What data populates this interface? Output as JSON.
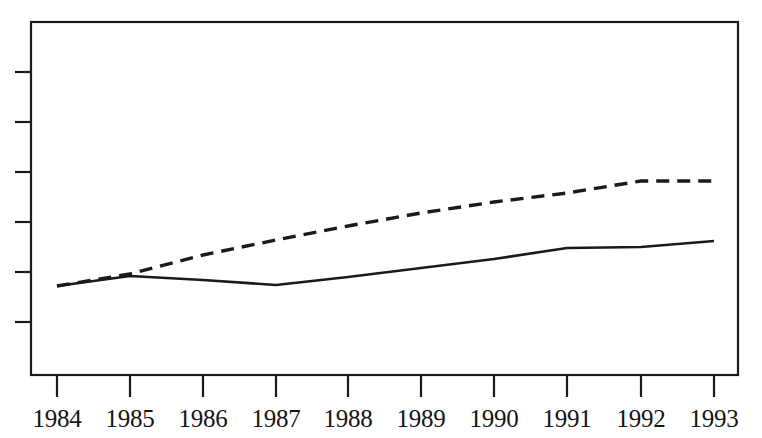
{
  "figure": {
    "background_color": "#ffffff",
    "ink_color": "#1a1a1a",
    "frame": {
      "left": 31,
      "top": 22,
      "right": 738,
      "bottom": 375
    }
  },
  "chart_data": {
    "type": "line",
    "title": "",
    "subtitle": "",
    "xlabel": "",
    "ylabel": "",
    "grid": false,
    "legend_position": "none",
    "categories": [
      "1984",
      "1985",
      "1986",
      "1987",
      "1988",
      "1989",
      "1990",
      "1991",
      "1992",
      "1993"
    ],
    "x": [
      1984,
      1985,
      1986,
      1987,
      1988,
      1989,
      1990,
      1991,
      1992,
      1993
    ],
    "xlim": [
      1984,
      1993
    ],
    "ylim": [
      0,
      100
    ],
    "y_axis": {
      "tick_labels": [],
      "tick_count": 6,
      "tick_pixel_positions": [
        72,
        122,
        172,
        222,
        272,
        322
      ],
      "labels_shown": false
    },
    "x_axis": {
      "tick_labels": [
        "1984",
        "1985",
        "1986",
        "1987",
        "1988",
        "1989",
        "1990",
        "1991",
        "1992",
        "1993"
      ],
      "tick_pixel_positions": [
        57,
        130,
        203,
        276,
        348,
        421,
        494,
        567,
        641,
        714
      ]
    },
    "series": [
      {
        "name": "solid-series",
        "style": "solid",
        "color": "#1a1a1a",
        "values": [
          26,
          29,
          28,
          26,
          30,
          34,
          38,
          46,
          47,
          49
        ],
        "pixel_y": [
          286,
          276,
          280,
          285,
          277,
          268,
          259,
          248,
          247,
          241
        ]
      },
      {
        "name": "dashed-series",
        "style": "dashed",
        "color": "#1a1a1a",
        "values": [
          26,
          31,
          39,
          47,
          55,
          62,
          69,
          76,
          82,
          82
        ],
        "pixel_y": [
          286,
          274,
          255,
          240,
          226,
          213,
          202,
          193,
          181,
          181
        ]
      }
    ],
    "annotations": []
  }
}
